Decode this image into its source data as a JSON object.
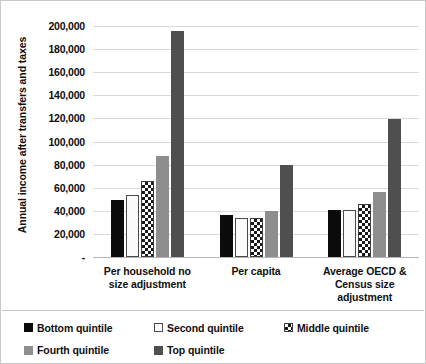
{
  "chart_data": {
    "type": "bar",
    "title": "",
    "xlabel": "",
    "ylabel": "Annual income after transfers and taxes",
    "ylim": [
      0,
      200000
    ],
    "ytick_labels": [
      "200,000",
      "180,000",
      "160,000",
      "140,000",
      "120,000",
      "100,000",
      "80,000",
      "60,000",
      "40,000",
      "20,000",
      "-"
    ],
    "ytick_values": [
      200000,
      180000,
      160000,
      140000,
      120000,
      100000,
      80000,
      60000,
      40000,
      20000,
      0
    ],
    "grid": true,
    "legend_position": "bottom",
    "categories": [
      "Per household no size adjustment",
      "Per capita",
      "Average OECD & Census size adjustment"
    ],
    "series": [
      {
        "name": "Bottom quintile",
        "color": "#0b0b0b",
        "pattern": "solid",
        "values": [
          49000,
          36000,
          41000
        ]
      },
      {
        "name": "Second quintile",
        "color": "#ffffff",
        "pattern": "outline",
        "values": [
          54000,
          34000,
          40500
        ]
      },
      {
        "name": "Middle quintile",
        "color": "#ffffff",
        "pattern": "checkered",
        "values": [
          65500,
          33500,
          46000
        ]
      },
      {
        "name": "Fourth quintile",
        "color": "#8e8e8e",
        "pattern": "solid",
        "values": [
          87500,
          40000,
          56500
        ]
      },
      {
        "name": "Top quintile",
        "color": "#4f4f4f",
        "pattern": "solid",
        "values": [
          196000,
          79500,
          119500
        ]
      }
    ]
  },
  "legend": {
    "items": [
      {
        "label": "Bottom quintile"
      },
      {
        "label": "Second quintile"
      },
      {
        "label": "Middle quintile"
      },
      {
        "label": "Fourth quintile"
      },
      {
        "label": "Top quintile"
      }
    ]
  }
}
